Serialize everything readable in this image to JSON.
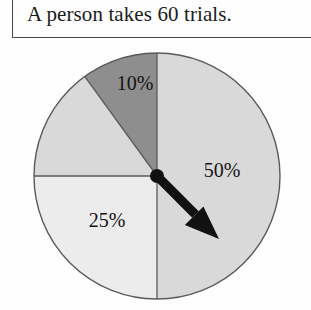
{
  "prompt": {
    "text": "A person takes 60 trials."
  },
  "chart_data": {
    "type": "pie",
    "title": "",
    "subtitle": "",
    "xlabel": "",
    "ylabel": "",
    "legend": "none",
    "grid": false,
    "note": "Spinner divided into four sectors; a black arrow/pointer is fixed at the centre pointing down-and-right into the 50% sector.",
    "categories": [
      "50%",
      "25%",
      "15%",
      "10%"
    ],
    "values": [
      50,
      25,
      15,
      10
    ],
    "labels_shown": [
      "50%",
      "25%",
      "10%"
    ],
    "slices": [
      {
        "label": "50%",
        "value": 50,
        "start_angle_deg": 0,
        "end_angle_deg": 180,
        "color": "#d9d9d9",
        "label_visible": true,
        "label_x": 222,
        "label_y": 132
      },
      {
        "label": "25%",
        "value": 25,
        "start_angle_deg": 180,
        "end_angle_deg": 270,
        "color": "#ececec",
        "label_visible": true,
        "label_x": 107,
        "label_y": 182
      },
      {
        "label": "15%",
        "value": 15,
        "start_angle_deg": 270,
        "end_angle_deg": 324,
        "color": "#d9d9d9",
        "label_visible": false,
        "label_x": 92,
        "label_y": 110
      },
      {
        "label": "10%",
        "value": 10,
        "start_angle_deg": 324,
        "end_angle_deg": 360,
        "color": "#8e8e8e",
        "label_visible": true,
        "label_x": 135,
        "label_y": 45
      }
    ],
    "pointer": {
      "angle_deg": 135,
      "center_x": 157,
      "center_y": 136,
      "tip_x": 219,
      "tip_y": 199,
      "color": "#111111"
    },
    "geometry": {
      "center_x": 157,
      "center_y": 136,
      "radius": 123
    },
    "colors": {
      "outline": "#5a5a5a",
      "dark_slice": "#8e8e8e",
      "mid_slice": "#d9d9d9",
      "light_slice": "#ececec",
      "pointer": "#111111",
      "text": "#131313"
    }
  }
}
